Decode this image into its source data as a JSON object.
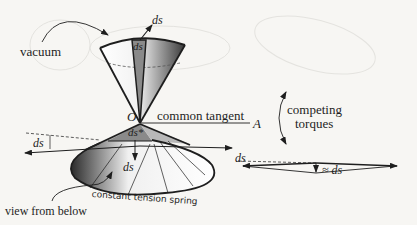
{
  "figure": {
    "labels": {
      "vacuum": "vacuum",
      "ds_top_arrow": "ds",
      "ds_top_strip": "ds",
      "origin": "O",
      "common_tangent": "common tangent",
      "point_a": "A",
      "competing_torques_line1": "competing",
      "competing_torques_line2": "torques",
      "ds_left": "ds",
      "ds_star": "ds*",
      "ds_down": "ds",
      "constant_tension_spring": "constant tension spring",
      "view_from_below": "view from below",
      "ds_right_diagram": "ds",
      "approx_ds": "≈ ds"
    },
    "colors": {
      "ink": "#1e1e1e",
      "background": "#f7f6f3",
      "strip_fill": "#8a8a8a",
      "shade_dark": "#2a2a2a",
      "ghost": "#e4e3df"
    }
  }
}
